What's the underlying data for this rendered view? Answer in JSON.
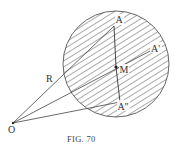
{
  "figure": {
    "caption": "FIG. 70",
    "labels": {
      "A": "A",
      "A_prime": "A'",
      "A_double_prime": "A''",
      "M": "M",
      "R": "R",
      "O": "O"
    },
    "colors": {
      "stroke": "#444444",
      "hatch": "#666666",
      "background": "#ffffff"
    },
    "points": {
      "O": [
        13,
        123
      ],
      "A": [
        114,
        26
      ],
      "A_prime": [
        152,
        50
      ],
      "A_double_prime": [
        120,
        102
      ],
      "M": [
        116,
        67
      ],
      "circle_center": [
        116,
        64
      ],
      "circle_radius": 53
    }
  }
}
